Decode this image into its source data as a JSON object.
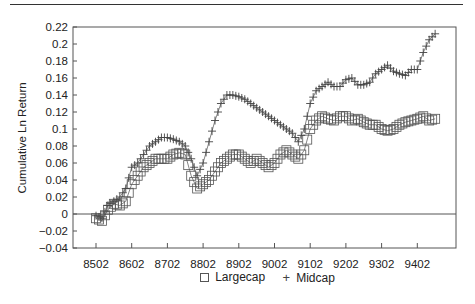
{
  "chart_data": {
    "type": "line",
    "title": "",
    "xlabel": "",
    "ylabel": "Cumulative Ln Return",
    "ylim": [
      -0.04,
      0.22
    ],
    "yticks": [
      -0.04,
      -0.02,
      0,
      0.02,
      0.04,
      0.06,
      0.08,
      0.1,
      0.12,
      0.14,
      0.16,
      0.18,
      0.2,
      0.22
    ],
    "ytick_labels": [
      "−0.04",
      "−0.02",
      "0",
      "0.02",
      "0.04",
      "0.06",
      "0.08",
      "0.1",
      "0.12",
      "0.14",
      "0.16",
      "0.18",
      "0.2",
      "0.22"
    ],
    "xtick_labels": [
      "8502",
      "8602",
      "8702",
      "8802",
      "8902",
      "9002",
      "9102",
      "9202",
      "9302",
      "9402"
    ],
    "grid": false,
    "zero_line": true,
    "legend_position": "bottom",
    "x": [
      "8502",
      "8504",
      "8506",
      "8508",
      "8510",
      "8512",
      "8602",
      "8604",
      "8606",
      "8608",
      "8610",
      "8612",
      "8702",
      "8704",
      "8706",
      "8708",
      "8710",
      "8712",
      "8802",
      "8804",
      "8806",
      "8808",
      "8810",
      "8812",
      "8902",
      "8904",
      "8906",
      "8908",
      "8910",
      "8912",
      "9002",
      "9004",
      "9006",
      "9008",
      "9010",
      "9012",
      "9102",
      "9104",
      "9106",
      "9108",
      "9110",
      "9112",
      "9202",
      "9204",
      "9206",
      "9208",
      "9210",
      "9212",
      "9302",
      "9304",
      "9306",
      "9308",
      "9310",
      "9312",
      "9402",
      "9404",
      "9406",
      "9408"
    ],
    "series": [
      {
        "name": "Largecap",
        "marker": "square",
        "values": [
          -0.005,
          -0.008,
          0.005,
          0.012,
          0.01,
          0.015,
          0.035,
          0.045,
          0.055,
          0.06,
          0.065,
          0.065,
          0.065,
          0.07,
          0.072,
          0.07,
          0.045,
          0.03,
          0.035,
          0.04,
          0.05,
          0.06,
          0.065,
          0.07,
          0.07,
          0.065,
          0.06,
          0.065,
          0.06,
          0.055,
          0.06,
          0.07,
          0.075,
          0.07,
          0.065,
          0.075,
          0.1,
          0.11,
          0.115,
          0.112,
          0.11,
          0.115,
          0.115,
          0.11,
          0.112,
          0.108,
          0.105,
          0.105,
          0.1,
          0.098,
          0.1,
          0.105,
          0.108,
          0.11,
          0.112,
          0.115,
          0.11,
          0.112
        ]
      },
      {
        "name": "Midcap",
        "marker": "plus",
        "values": [
          -0.002,
          -0.005,
          0.01,
          0.015,
          0.02,
          0.03,
          0.055,
          0.06,
          0.07,
          0.08,
          0.085,
          0.09,
          0.09,
          0.088,
          0.085,
          0.08,
          0.065,
          0.045,
          0.06,
          0.085,
          0.11,
          0.13,
          0.14,
          0.14,
          0.138,
          0.135,
          0.13,
          0.125,
          0.12,
          0.115,
          0.11,
          0.105,
          0.1,
          0.095,
          0.085,
          0.1,
          0.13,
          0.145,
          0.15,
          0.155,
          0.15,
          0.15,
          0.158,
          0.16,
          0.152,
          0.152,
          0.155,
          0.165,
          0.17,
          0.175,
          0.168,
          0.165,
          0.163,
          0.17,
          0.17,
          0.19,
          0.205,
          0.212
        ]
      }
    ]
  },
  "legend": {
    "items": [
      {
        "label": "Largecap",
        "symbol": "□"
      },
      {
        "label": "Midcap",
        "symbol": "+"
      }
    ]
  }
}
